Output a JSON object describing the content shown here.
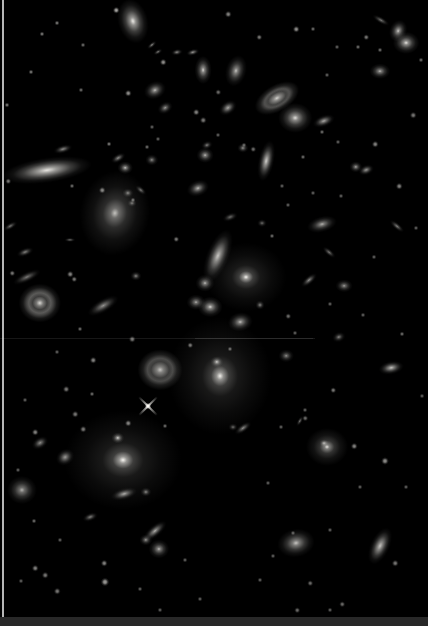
{
  "scene": {
    "subject": "deep-field-photograph-of-galaxy-cluster",
    "width": 428,
    "height": 626,
    "background": "#000000",
    "galaxy_fields": [
      "type",
      "x",
      "y",
      "rx",
      "ry",
      "rot_deg",
      "brightness",
      "spread"
    ],
    "galaxies": [
      [
        "edge",
        47,
        170,
        24,
        6.5,
        -8,
        0.92
      ],
      [
        "ell",
        133,
        21,
        8,
        12,
        -15,
        0.95
      ],
      [
        "spiral",
        277,
        98,
        13,
        7,
        -30,
        0.85
      ],
      [
        "ell",
        295,
        118,
        9,
        8,
        0,
        0.88
      ],
      [
        "ell",
        236,
        71,
        5.5,
        8.5,
        15,
        0.8
      ],
      [
        "ell",
        203,
        70,
        4.5,
        7.5,
        0,
        0.85
      ],
      [
        "edge",
        266,
        161,
        4,
        11,
        12,
        0.85
      ],
      [
        "blob",
        356,
        167,
        3.5,
        3,
        0,
        0.7
      ],
      [
        "edge",
        366,
        170,
        4,
        2.5,
        -20,
        0.65
      ],
      [
        "ell",
        398,
        31,
        4.5,
        6,
        20,
        0.85
      ],
      [
        "ell",
        406,
        43,
        7,
        6,
        0,
        0.9
      ],
      [
        "ell",
        380,
        71,
        5.5,
        4,
        0,
        0.75
      ],
      [
        "bright",
        115,
        213,
        18,
        22,
        10,
        0.78,
        2.2
      ],
      [
        "ring",
        40,
        303,
        11,
        10,
        0,
        0.85
      ],
      [
        "edge",
        27,
        277,
        8,
        2.5,
        -25,
        0.5
      ],
      [
        "edge",
        103,
        306,
        9,
        3.5,
        -30,
        0.6
      ],
      [
        "spiral",
        160,
        370,
        12,
        11,
        0,
        0.78
      ],
      [
        "cd",
        246,
        277,
        20,
        17,
        0,
        0.98,
        2.2
      ],
      [
        "edge",
        218,
        256,
        6,
        15,
        22,
        0.8
      ],
      [
        "ell",
        205,
        283,
        5,
        4.5,
        0,
        0.75
      ],
      [
        "ell",
        196,
        302,
        5,
        4,
        0,
        0.7
      ],
      [
        "ell",
        210,
        307,
        6.5,
        5.5,
        0,
        0.85
      ],
      [
        "ell",
        240,
        322,
        6.5,
        5,
        -10,
        0.8
      ],
      [
        "cd",
        220,
        376,
        28,
        32,
        0,
        0.95,
        2.0
      ],
      [
        "blob",
        217,
        362,
        3.5,
        3,
        0,
        0.85
      ],
      [
        "cd",
        123,
        460,
        32,
        27,
        0,
        0.98,
        2.0
      ],
      [
        "blob",
        118,
        438,
        3.5,
        3,
        0,
        0.9
      ],
      [
        "ell",
        22,
        490,
        8,
        7.5,
        0,
        0.7
      ],
      [
        "edge",
        40,
        443,
        4.5,
        3,
        -30,
        0.6
      ],
      [
        "edge",
        65,
        457,
        5,
        4,
        -35,
        0.65
      ],
      [
        "edge",
        124,
        494,
        7,
        3,
        -15,
        0.7
      ],
      [
        "blob",
        146,
        492,
        3,
        2.5,
        0,
        0.6
      ],
      [
        "edge",
        90,
        517,
        4,
        2,
        -20,
        0.55
      ],
      [
        "edge",
        155,
        531,
        7.5,
        3,
        -40,
        0.7
      ],
      [
        "blob",
        146,
        540,
        3.5,
        3,
        0,
        0.65
      ],
      [
        "ell",
        159,
        549,
        5.5,
        5,
        0,
        0.75
      ],
      [
        "bright",
        327,
        447,
        10,
        9,
        0,
        0.9,
        2.4
      ],
      [
        "blob",
        324,
        443,
        2.5,
        2,
        0,
        0.75
      ],
      [
        "ell",
        296,
        543,
        10,
        7.5,
        -10,
        0.8
      ],
      [
        "edge",
        380,
        546,
        5,
        10.5,
        25,
        0.8
      ],
      [
        "edge",
        243,
        428,
        5,
        2,
        -35,
        0.6
      ],
      [
        "blob",
        233,
        427,
        2.5,
        2,
        0,
        0.5
      ],
      [
        "edge",
        324,
        121,
        6,
        3,
        -20,
        0.7
      ],
      [
        "ell",
        322,
        224,
        8,
        4,
        -15,
        0.75
      ],
      [
        "edge",
        329,
        252,
        4,
        1.5,
        40,
        0.5
      ],
      [
        "edge",
        309,
        280,
        5,
        2,
        -40,
        0.6
      ],
      [
        "ell",
        344,
        286,
        4.5,
        3.5,
        0,
        0.65
      ],
      [
        "blob",
        339,
        337,
        3.5,
        2.5,
        -20,
        0.6
      ],
      [
        "edge",
        391,
        368,
        6.5,
        3.5,
        -10,
        0.8
      ],
      [
        "blob",
        286,
        356,
        4,
        3.5,
        0,
        0.6
      ],
      [
        "edge",
        397,
        226,
        4.5,
        1.5,
        40,
        0.55
      ],
      [
        "blob",
        125,
        168,
        4,
        3.5,
        0,
        0.8
      ],
      [
        "edge",
        118,
        158,
        4,
        2,
        -30,
        0.6
      ],
      [
        "blob",
        128,
        193,
        3,
        2.5,
        0,
        0.6
      ],
      [
        "blob",
        132,
        203,
        2.5,
        2,
        0,
        0.55
      ],
      [
        "edge",
        141,
        190,
        3.5,
        1.5,
        40,
        0.5
      ],
      [
        "ell",
        198,
        188,
        6,
        4,
        -20,
        0.8
      ],
      [
        "ell",
        205,
        155,
        4.5,
        4,
        0,
        0.75
      ],
      [
        "edge",
        63,
        149,
        5,
        2,
        -15,
        0.6
      ],
      [
        "blob",
        152,
        160,
        3.5,
        3,
        0,
        0.6
      ],
      [
        "edge",
        25,
        252,
        4.5,
        2,
        -20,
        0.55
      ],
      [
        "edge",
        152,
        45,
        3,
        1.2,
        -40,
        0.6
      ],
      [
        "edge",
        158,
        52,
        2.5,
        1.2,
        -30,
        0.55
      ],
      [
        "edge",
        177,
        52,
        3,
        1.5,
        -10,
        0.6
      ],
      [
        "edge",
        193,
        52,
        3.5,
        1.5,
        -15,
        0.65
      ],
      [
        "edge",
        381,
        20,
        5,
        1.5,
        30,
        0.5
      ],
      [
        "edge",
        230,
        217,
        4,
        2,
        -20,
        0.45
      ],
      [
        "blob",
        262,
        223,
        2.5,
        2,
        0,
        0.5
      ],
      [
        "blob",
        136,
        276,
        3,
        2.5,
        0,
        0.6
      ],
      [
        "edge",
        70,
        240,
        3,
        1.2,
        0,
        0.45
      ],
      [
        "edge",
        10,
        226,
        4,
        1.5,
        -30,
        0.5
      ],
      [
        "ell",
        155,
        90,
        6,
        4.5,
        -25,
        0.8
      ],
      [
        "blob",
        165,
        108,
        4,
        3,
        -30,
        0.7
      ],
      [
        "edge",
        228,
        108,
        5,
        3.5,
        -35,
        0.7
      ],
      [
        "blob",
        207,
        145,
        3,
        2,
        -20,
        0.6
      ],
      [
        "blob",
        243,
        148,
        3,
        2.5,
        0,
        0.65
      ],
      [
        "blob",
        260,
        305,
        2.5,
        2.5,
        0,
        0.6
      ],
      [
        "edge",
        300,
        421,
        3,
        1.2,
        -60,
        0.5
      ]
    ],
    "diffraction_stars": [
      {
        "x": 148,
        "y": 406,
        "size": 26,
        "brightness": 0.95
      }
    ],
    "star_fields": [
      "x",
      "y",
      "r",
      "brightness"
    ],
    "stars": [
      [
        116,
        10,
        1.5,
        0.7
      ],
      [
        57,
        23,
        1.2,
        0.5
      ],
      [
        42,
        34,
        1.2,
        0.5
      ],
      [
        83,
        45,
        1.2,
        0.45
      ],
      [
        31,
        72,
        1.2,
        0.5
      ],
      [
        81,
        90,
        1.2,
        0.45
      ],
      [
        128,
        93,
        1.5,
        0.6
      ],
      [
        7,
        105,
        1.2,
        0.5
      ],
      [
        109,
        144,
        1.2,
        0.5
      ],
      [
        147,
        147,
        1.2,
        0.45
      ],
      [
        8,
        181,
        1.3,
        0.5
      ],
      [
        72,
        186,
        1.2,
        0.45
      ],
      [
        102,
        190,
        1.5,
        0.55
      ],
      [
        133,
        200,
        1.2,
        0.45
      ],
      [
        196,
        112,
        1.5,
        0.55
      ],
      [
        152,
        127,
        1.2,
        0.4
      ],
      [
        163,
        62,
        1.5,
        0.6
      ],
      [
        203,
        120,
        1.5,
        0.5
      ],
      [
        218,
        92,
        1.3,
        0.45
      ],
      [
        218,
        135,
        1.2,
        0.4
      ],
      [
        158,
        139,
        1.2,
        0.4
      ],
      [
        228,
        14,
        1.5,
        0.55
      ],
      [
        296,
        29,
        1.5,
        0.6
      ],
      [
        259,
        37,
        1.3,
        0.5
      ],
      [
        358,
        47,
        1.2,
        0.45
      ],
      [
        322,
        132,
        1.2,
        0.45
      ],
      [
        338,
        142,
        1.2,
        0.4
      ],
      [
        375,
        144,
        1.5,
        0.55
      ],
      [
        303,
        157,
        1.2,
        0.45
      ],
      [
        399,
        186,
        1.5,
        0.55
      ],
      [
        341,
        196,
        1.2,
        0.4
      ],
      [
        413,
        115,
        1.5,
        0.5
      ],
      [
        421,
        60,
        1.2,
        0.45
      ],
      [
        366,
        37,
        1.3,
        0.5
      ],
      [
        380,
        50,
        1.2,
        0.45
      ],
      [
        313,
        29,
        1.2,
        0.45
      ],
      [
        337,
        47,
        1.2,
        0.4
      ],
      [
        327,
        75,
        1.2,
        0.4
      ],
      [
        244,
        145,
        1.2,
        0.4
      ],
      [
        253,
        149,
        1.3,
        0.45
      ],
      [
        313,
        193,
        1.2,
        0.4
      ],
      [
        282,
        186,
        1.2,
        0.4
      ],
      [
        288,
        205,
        1.2,
        0.4
      ],
      [
        12,
        273,
        1.3,
        0.5
      ],
      [
        70,
        274,
        1.5,
        0.55
      ],
      [
        74,
        279,
        1.3,
        0.5
      ],
      [
        80,
        329,
        1.2,
        0.45
      ],
      [
        132,
        339,
        1.5,
        0.5
      ],
      [
        57,
        352,
        1.2,
        0.4
      ],
      [
        93,
        360,
        1.5,
        0.55
      ],
      [
        66,
        389,
        1.5,
        0.5
      ],
      [
        92,
        394,
        1.2,
        0.45
      ],
      [
        75,
        414,
        1.5,
        0.5
      ],
      [
        128,
        423,
        1.5,
        0.55
      ],
      [
        25,
        400,
        1.2,
        0.4
      ],
      [
        176,
        239,
        1.3,
        0.5
      ],
      [
        190,
        345,
        1.3,
        0.5
      ],
      [
        230,
        349,
        1.2,
        0.45
      ],
      [
        288,
        316,
        1.3,
        0.45
      ],
      [
        295,
        333,
        1.2,
        0.4
      ],
      [
        272,
        236,
        1.2,
        0.45
      ],
      [
        374,
        257,
        1.2,
        0.4
      ],
      [
        330,
        304,
        1.2,
        0.4
      ],
      [
        402,
        334,
        1.2,
        0.45
      ],
      [
        333,
        390,
        1.3,
        0.5
      ],
      [
        305,
        410,
        1.2,
        0.4
      ],
      [
        416,
        228,
        1.2,
        0.4
      ],
      [
        422,
        396,
        1.2,
        0.4
      ],
      [
        363,
        315,
        1.2,
        0.4
      ],
      [
        35,
        432,
        1.5,
        0.55
      ],
      [
        83,
        429,
        1.5,
        0.5
      ],
      [
        165,
        426,
        1.2,
        0.45
      ],
      [
        18,
        470,
        1.2,
        0.4
      ],
      [
        34,
        521,
        1.2,
        0.45
      ],
      [
        60,
        540,
        1.2,
        0.4
      ],
      [
        35,
        568,
        1.5,
        0.55
      ],
      [
        45,
        575,
        1.5,
        0.5
      ],
      [
        104,
        563,
        1.5,
        0.55
      ],
      [
        105,
        582,
        2,
        0.65
      ],
      [
        57,
        591,
        1.5,
        0.5
      ],
      [
        140,
        589,
        1.2,
        0.4
      ],
      [
        21,
        581,
        1.2,
        0.4
      ],
      [
        185,
        560,
        1.2,
        0.4
      ],
      [
        200,
        599,
        1.2,
        0.4
      ],
      [
        160,
        610,
        1.2,
        0.4
      ],
      [
        305,
        418,
        1.3,
        0.45
      ],
      [
        268,
        483,
        1.2,
        0.4
      ],
      [
        385,
        461,
        1.8,
        0.6
      ],
      [
        354,
        446,
        1.5,
        0.55
      ],
      [
        360,
        487,
        1.2,
        0.4
      ],
      [
        330,
        530,
        1.2,
        0.4
      ],
      [
        395,
        563,
        1.5,
        0.5
      ],
      [
        310,
        583,
        1.3,
        0.45
      ],
      [
        260,
        580,
        1.2,
        0.4
      ],
      [
        297,
        610,
        1.3,
        0.45
      ],
      [
        330,
        610,
        1.2,
        0.4
      ],
      [
        406,
        487,
        1.2,
        0.4
      ],
      [
        281,
        427,
        1.2,
        0.4
      ],
      [
        293,
        533,
        1.2,
        0.4
      ],
      [
        273,
        556,
        1.2,
        0.4
      ],
      [
        342,
        604,
        1.3,
        0.45
      ]
    ],
    "artifacts": [
      {
        "kind": "vline",
        "x": 2,
        "y": 0,
        "w": 1.5,
        "h": 626,
        "color": "rgba(228,228,228,0.8)",
        "name": "photo-edge-line"
      },
      {
        "kind": "band",
        "x": 0,
        "y": 617,
        "w": 428,
        "h": 9,
        "color": "#282828",
        "name": "photo-bottom-border"
      },
      {
        "kind": "hline",
        "x": 0,
        "y": 338,
        "w": 315,
        "h": 1,
        "color": "rgba(255,255,255,0.09)",
        "name": "scan-scratch-line"
      },
      {
        "kind": "hline",
        "x": 195,
        "y": 338,
        "w": 118,
        "h": 1,
        "color": "rgba(255,255,255,0.09)",
        "name": "scan-scratch-line"
      }
    ]
  }
}
